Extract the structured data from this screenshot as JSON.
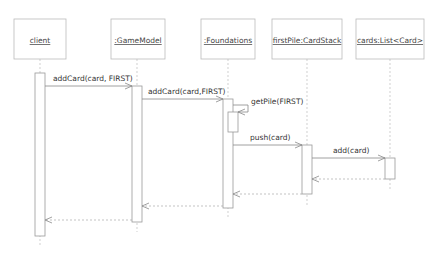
{
  "diagram": {
    "type": "sequence",
    "lifelines": [
      {
        "id": "client",
        "label": "client",
        "x": 40
      },
      {
        "id": "gamemodel",
        "label": ":GameModel",
        "x": 137
      },
      {
        "id": "foundations",
        "label": ":Foundations",
        "x": 228
      },
      {
        "id": "firstpile",
        "label": "firstPile:CardStack",
        "x": 307
      },
      {
        "id": "cards",
        "label": "cards:List<Card>",
        "x": 390
      }
    ],
    "messages": [
      {
        "id": "m1",
        "label": "addCard(card, FIRST)",
        "from": "client",
        "to": "gamemodel",
        "kind": "call"
      },
      {
        "id": "m2",
        "label": "addCard(card,FIRST)",
        "from": "gamemodel",
        "to": "foundations",
        "kind": "call"
      },
      {
        "id": "m3",
        "label": "getPile(FIRST)",
        "from": "foundations",
        "to": "foundations",
        "kind": "self-call"
      },
      {
        "id": "m4",
        "label": "push(card)",
        "from": "foundations",
        "to": "firstpile",
        "kind": "call"
      },
      {
        "id": "m5",
        "label": "add(card)",
        "from": "firstpile",
        "to": "cards",
        "kind": "call"
      },
      {
        "id": "r5",
        "label": "",
        "from": "cards",
        "to": "firstpile",
        "kind": "return"
      },
      {
        "id": "r4",
        "label": "",
        "from": "firstpile",
        "to": "foundations",
        "kind": "return"
      },
      {
        "id": "r2",
        "label": "",
        "from": "foundations",
        "to": "gamemodel",
        "kind": "return"
      },
      {
        "id": "r1",
        "label": "",
        "from": "gamemodel",
        "to": "client",
        "kind": "return"
      }
    ]
  }
}
